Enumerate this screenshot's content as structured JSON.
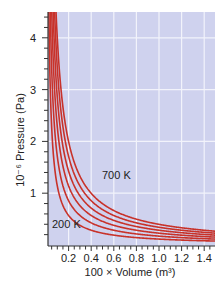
{
  "chart_data": {
    "type": "line",
    "title": "",
    "xlabel": "100 × Volume (m³)",
    "ylabel": "10⁻⁶ Pressure (Pa)",
    "xlim": [
      0,
      1.5
    ],
    "ylim": [
      0,
      4.5
    ],
    "x_ticks": [
      0.2,
      0.4,
      0.6,
      0.8,
      1.0,
      1.2,
      1.4
    ],
    "x_tick_labels": [
      "0.2",
      "0.4",
      "0.6",
      "0.8",
      "1.0",
      "1.2",
      "1.4"
    ],
    "y_ticks": [
      1,
      2,
      3,
      4
    ],
    "y_tick_labels": [
      "1",
      "2",
      "3",
      "4"
    ],
    "grid": true,
    "legend": "none",
    "annotations": [
      {
        "text": "200 K",
        "x": 0.05,
        "y": 0.45
      },
      {
        "text": "700 K",
        "x": 0.62,
        "y": 1.35
      }
    ],
    "series": [
      {
        "name": "200 K",
        "temperature": 200,
        "PV_constant": 0.114
      },
      {
        "name": "300 K",
        "temperature": 300,
        "PV_constant": 0.171
      },
      {
        "name": "400 K",
        "temperature": 400,
        "PV_constant": 0.228
      },
      {
        "name": "500 K",
        "temperature": 500,
        "PV_constant": 0.285
      },
      {
        "name": "600 K",
        "temperature": 600,
        "PV_constant": 0.342
      },
      {
        "name": "700 K",
        "temperature": 700,
        "PV_constant": 0.399
      }
    ],
    "sample_points": {
      "x": [
        0.2,
        0.4,
        0.6,
        0.8,
        1.0,
        1.2,
        1.4
      ],
      "700 K": [
        2.0,
        1.0,
        0.67,
        0.5,
        0.4,
        0.33,
        0.29
      ],
      "200 K": [
        0.57,
        0.29,
        0.19,
        0.14,
        0.11,
        0.1,
        0.08
      ]
    }
  },
  "colors": {
    "plot_background": "#cfd2ee",
    "grid": "#f2f3fb",
    "curve": "#c8322a",
    "curve_highlight": "#f0a040",
    "axis": "#333333"
  }
}
